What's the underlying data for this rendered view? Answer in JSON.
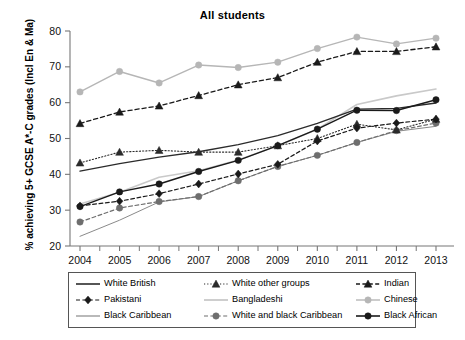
{
  "chart_data": {
    "type": "line",
    "title": "All students",
    "xlabel": "",
    "ylabel": "% achieving 5+ GCSE A*-C grades (Incl En & Ma)",
    "x": [
      2004,
      2005,
      2006,
      2007,
      2008,
      2009,
      2010,
      2011,
      2012,
      2013
    ],
    "xtick_labels": [
      "2004",
      "2005",
      "2006",
      "2007",
      "2008",
      "2009",
      "2010",
      "2011",
      "2012",
      "2013"
    ],
    "ytick_labels": [
      "20",
      "30",
      "40",
      "50",
      "60",
      "70",
      "80"
    ],
    "yticks": [
      20,
      30,
      40,
      50,
      60,
      70,
      80
    ],
    "ylim": [
      20,
      80
    ],
    "xlim": [
      2004,
      2013
    ],
    "grid": false,
    "legend_position": "bottom",
    "series": [
      {
        "name": "White British",
        "style": "solid",
        "marker": "none",
        "color": "#2b2b2b",
        "width": 1.4,
        "values": [
          40.9,
          43.0,
          44.8,
          46.3,
          48.3,
          50.8,
          54.2,
          58.2,
          58.4,
          59.9
        ]
      },
      {
        "name": "White other groups",
        "style": "dotted",
        "marker": "triangle",
        "color": "#2b2b2b",
        "width": 1.1,
        "values": [
          43.2,
          46.2,
          46.7,
          46.2,
          46.2,
          48.0,
          50.0,
          54.0,
          52.4,
          55.4
        ]
      },
      {
        "name": "Indian",
        "style": "dashed",
        "marker": "triangle",
        "color": "#1a1a1a",
        "width": 1.3,
        "values": [
          54.2,
          57.4,
          59.1,
          62.0,
          65.0,
          67.0,
          71.3,
          74.3,
          74.3,
          75.6
        ]
      },
      {
        "name": "Pakistani",
        "style": "dashed",
        "marker": "diamond",
        "color": "#1a1a1a",
        "width": 1.2,
        "values": [
          31.2,
          32.5,
          34.6,
          37.3,
          40.1,
          42.8,
          49.3,
          52.9,
          54.3,
          55.4
        ]
      },
      {
        "name": "Bangladeshi",
        "style": "solid",
        "marker": "none",
        "color": "#c9c9c9",
        "width": 1.6,
        "values": [
          31.7,
          35.0,
          39.2,
          41.0,
          44.0,
          48.0,
          52.6,
          59.5,
          61.9,
          63.8
        ]
      },
      {
        "name": "Chinese",
        "style": "solid",
        "marker": "circle",
        "color": "#b6b6b6",
        "width": 1.4,
        "values": [
          63.0,
          68.7,
          65.5,
          70.5,
          69.8,
          71.3,
          75.1,
          78.3,
          76.4,
          78.0
        ]
      },
      {
        "name": "Black Caribbean",
        "style": "solid",
        "marker": "none",
        "color": "#8a8a8a",
        "width": 1.0,
        "values": [
          22.7,
          27.2,
          32.3,
          33.8,
          38.2,
          42.2,
          45.3,
          48.9,
          52.0,
          53.4
        ]
      },
      {
        "name": "White and black Caribbean",
        "style": "dashed",
        "marker": "circle",
        "color": "#6e6e6e",
        "width": 1.2,
        "values": [
          26.7,
          30.6,
          32.4,
          33.8,
          38.2,
          42.2,
          45.3,
          48.9,
          52.2,
          54.3
        ]
      },
      {
        "name": "Black African",
        "style": "solid",
        "marker": "circle",
        "color": "#1a1a1a",
        "width": 1.4,
        "values": [
          31.0,
          35.1,
          37.3,
          40.8,
          43.9,
          48.0,
          52.6,
          57.9,
          57.8,
          60.8
        ]
      }
    ]
  },
  "legend": {
    "items": [
      {
        "label": "White British",
        "key": "line-solid-dark"
      },
      {
        "label": "White other groups",
        "key": "line-dotted-triangle"
      },
      {
        "label": "Indian",
        "key": "line-dashed-triangle"
      },
      {
        "label": "Pakistani",
        "key": "line-dashed-diamond"
      },
      {
        "label": "Bangladeshi",
        "key": "line-solid-lightgray"
      },
      {
        "label": "Chinese",
        "key": "line-solid-gray-circle"
      },
      {
        "label": "Black Caribbean",
        "key": "line-solid-thin-gray"
      },
      {
        "label": "White and black Caribbean",
        "key": "line-dashed-gray-circle"
      },
      {
        "label": "Black African",
        "key": "line-solid-dark-circle"
      }
    ]
  }
}
